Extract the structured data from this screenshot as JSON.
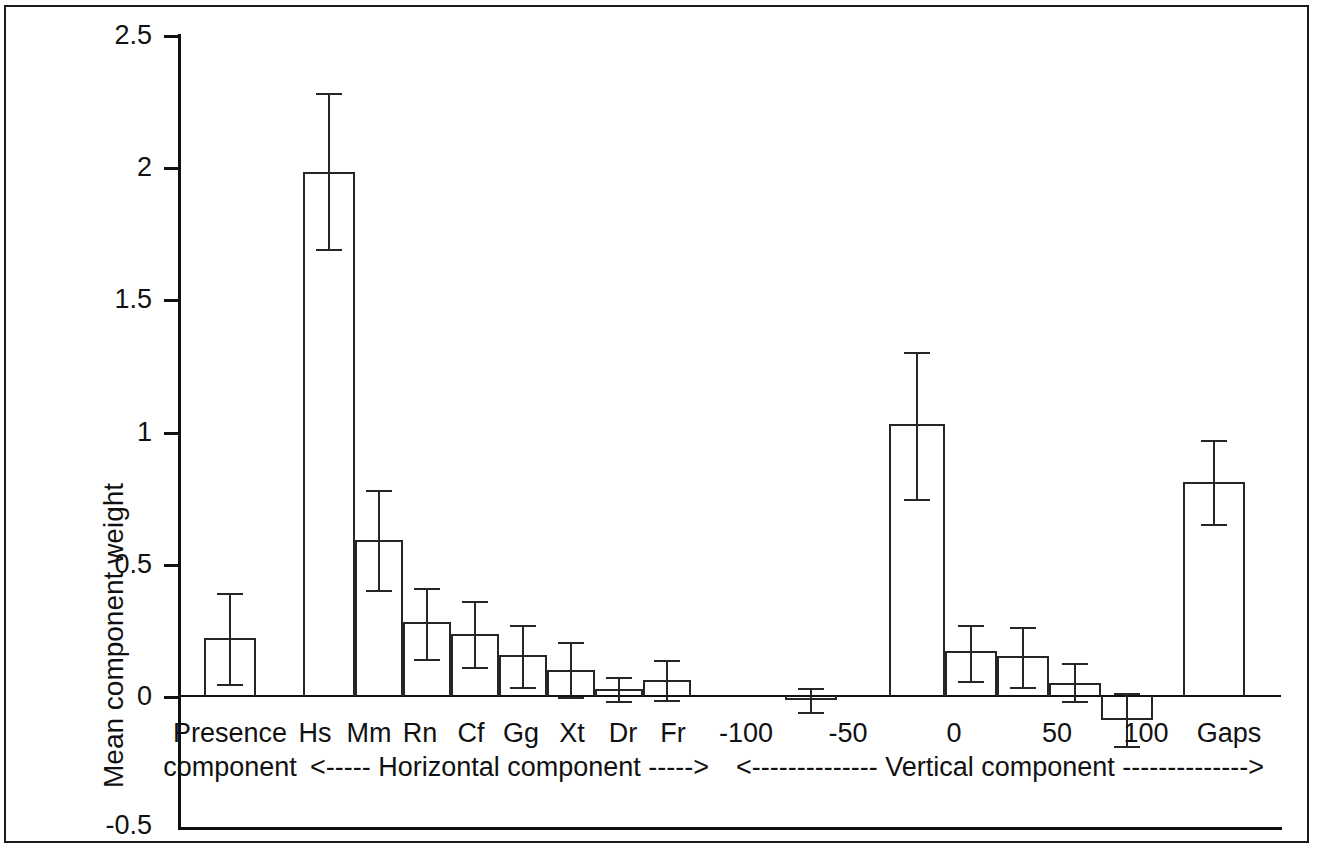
{
  "chart_data": {
    "type": "bar",
    "title": "",
    "xlabel": "",
    "ylabel": "Mean component weight",
    "ylim": [
      -0.5,
      2.5
    ],
    "ytick_labels": [
      "2.5",
      "2",
      "1.5",
      "1",
      "0.5",
      "0",
      "-0.5"
    ],
    "ytick_values": [
      2.5,
      2,
      1.5,
      1,
      0.5,
      0,
      -0.5
    ],
    "grid": false,
    "legend": "none",
    "error_bars": "symmetric (SE)",
    "group_labels": [
      "Presence component",
      "<----- Horizontal component ----->",
      "<-------------- Vertical component -------------->"
    ],
    "groups": [
      {
        "name": "Presence component",
        "label_line1": "Presence",
        "label_line2": "component",
        "arrow_label": "",
        "bars": [
          {
            "category": "Presence",
            "value": 0.22,
            "err_low": 0.045,
            "err_high": 0.39,
            "tick_label": ""
          }
        ]
      },
      {
        "name": "Horizontal component",
        "label_line1": "",
        "label_line2": "<----- Horizontal component ----->",
        "bars": [
          {
            "category": "Hs",
            "value": 1.98,
            "err_low": 1.69,
            "err_high": 2.28,
            "tick_label": "Hs"
          },
          {
            "category": "Mm",
            "value": 0.59,
            "err_low": 0.4,
            "err_high": 0.78,
            "tick_label": "Mm"
          },
          {
            "category": "Rn",
            "value": 0.28,
            "err_low": 0.14,
            "err_high": 0.41,
            "tick_label": "Rn"
          },
          {
            "category": "Cf",
            "value": 0.235,
            "err_low": 0.11,
            "err_high": 0.36,
            "tick_label": "Cf"
          },
          {
            "category": "Gg",
            "value": 0.155,
            "err_low": 0.035,
            "err_high": 0.27,
            "tick_label": "Gg"
          },
          {
            "category": "Xt",
            "value": 0.1,
            "err_low": -0.005,
            "err_high": 0.205,
            "tick_label": "Xt"
          },
          {
            "category": "Dr",
            "value": 0.025,
            "err_low": -0.02,
            "err_high": 0.07,
            "tick_label": "Dr"
          },
          {
            "category": "Fr",
            "value": 0.06,
            "err_low": -0.015,
            "err_high": 0.135,
            "tick_label": "Fr"
          }
        ]
      },
      {
        "name": "Vertical component",
        "label_line1": "",
        "label_line2": "<-------------- Vertical component -------------->",
        "tick_labels": [
          "-100",
          "-50",
          "0",
          "50",
          "100"
        ],
        "bars": [
          {
            "category": "-75",
            "value": -0.015,
            "err_low": -0.06,
            "err_high": 0.03,
            "tick_label": ""
          },
          {
            "category": "-25",
            "value": 1.03,
            "err_low": 0.745,
            "err_high": 1.3,
            "tick_label": ""
          },
          {
            "category": "25",
            "value": 0.17,
            "err_low": 0.055,
            "err_high": 0.27,
            "tick_label": ""
          },
          {
            "category": "50",
            "value": 0.15,
            "err_low": 0.035,
            "err_high": 0.26,
            "tick_label": ""
          },
          {
            "category": "75",
            "value": 0.05,
            "err_low": -0.02,
            "err_high": 0.125,
            "tick_label": ""
          },
          {
            "category": "100",
            "value": -0.09,
            "err_low": -0.19,
            "err_high": 0.01,
            "tick_label": ""
          }
        ]
      },
      {
        "name": "Gaps",
        "label_line1": "Gaps",
        "label_line2": "",
        "bars": [
          {
            "category": "Gaps",
            "value": 0.81,
            "err_low": 0.65,
            "err_high": 0.97,
            "tick_label": "Gaps"
          }
        ]
      }
    ],
    "categories": [
      "Presence",
      "Hs",
      "Mm",
      "Rn",
      "Cf",
      "Gg",
      "Xt",
      "Dr",
      "Fr",
      "-75",
      "-25",
      "25",
      "50",
      "75",
      "100",
      "Gaps"
    ],
    "values": [
      0.22,
      1.98,
      0.59,
      0.28,
      0.235,
      0.155,
      0.1,
      0.025,
      0.06,
      -0.015,
      1.03,
      0.17,
      0.15,
      0.05,
      -0.09,
      0.81
    ]
  },
  "axis": {
    "y_title": "Mean component weight",
    "ticks": [
      {
        "label": "2.5"
      },
      {
        "label": "2"
      },
      {
        "label": "1.5"
      },
      {
        "label": "1"
      },
      {
        "label": "0.5"
      },
      {
        "label": "0"
      },
      {
        "label": "-0.5"
      }
    ]
  },
  "xlabels": {
    "presence_line1": "Presence",
    "presence_line2": "component",
    "hs": "Hs",
    "mm": "Mm",
    "rn": "Rn",
    "cf": "Cf",
    "gg": "Gg",
    "xt": "Xt",
    "dr": "Dr",
    "fr": "Fr",
    "horizontal_arrow": "<----- Horizontal component ----->",
    "v_minus100": "-100",
    "v_minus50": "-50",
    "v_0": "0",
    "v_50": "50",
    "v_100": "100",
    "vertical_arrow": "<-------------- Vertical component -------------->",
    "gaps": "Gaps"
  },
  "colors": {
    "ink": "#111111",
    "bar_stroke": "#262626",
    "background": "#ffffff"
  }
}
